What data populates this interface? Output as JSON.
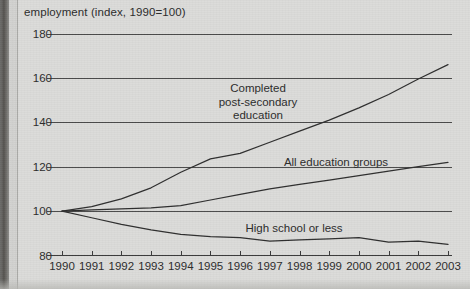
{
  "chart_data": {
    "type": "line",
    "title": "",
    "ylabel": "employment (index, 1990=100)",
    "xlabel": "",
    "grid": true,
    "legend_position": "inline-annotations",
    "ylim": [
      80,
      180
    ],
    "xlim": [
      1990,
      2003
    ],
    "yticks": [
      80,
      100,
      120,
      140,
      160,
      180
    ],
    "ytick_labels": [
      "80",
      "100",
      "120",
      "140",
      "160",
      "180"
    ],
    "x": [
      1990,
      1991,
      1992,
      1993,
      1994,
      1995,
      1996,
      1997,
      1998,
      1999,
      2000,
      2001,
      2002,
      2003
    ],
    "xtick_labels": [
      "1990",
      "1991",
      "1992",
      "1993",
      "1994",
      "1995",
      "1996",
      "1997",
      "1998",
      "1999",
      "2000",
      "2001",
      "2002",
      "2003"
    ],
    "series": [
      {
        "name": "Completed post-secondary education",
        "label_lines": "Completed\npost-secondary\neducation",
        "values": [
          100,
          102,
          105.5,
          110.5,
          117.5,
          123.5,
          126,
          131,
          136,
          141,
          146.5,
          152.5,
          159.5,
          166
        ]
      },
      {
        "name": "All education groups",
        "label_lines": "All education groups",
        "values": [
          100,
          100.5,
          101,
          101.5,
          102.5,
          105,
          107.5,
          110,
          112,
          114,
          116,
          118,
          120,
          122
        ]
      },
      {
        "name": "High school or less",
        "label_lines": "High school or less",
        "values": [
          100,
          97,
          94,
          91.5,
          89.5,
          88.5,
          88,
          86.5,
          87,
          87.5,
          88,
          86,
          86.5,
          85
        ]
      }
    ]
  },
  "annotations": {
    "postsecondary_label": "Completed\npost-secondary\neducation",
    "all_groups_label": "All education groups",
    "highschool_label": "High school or less"
  }
}
